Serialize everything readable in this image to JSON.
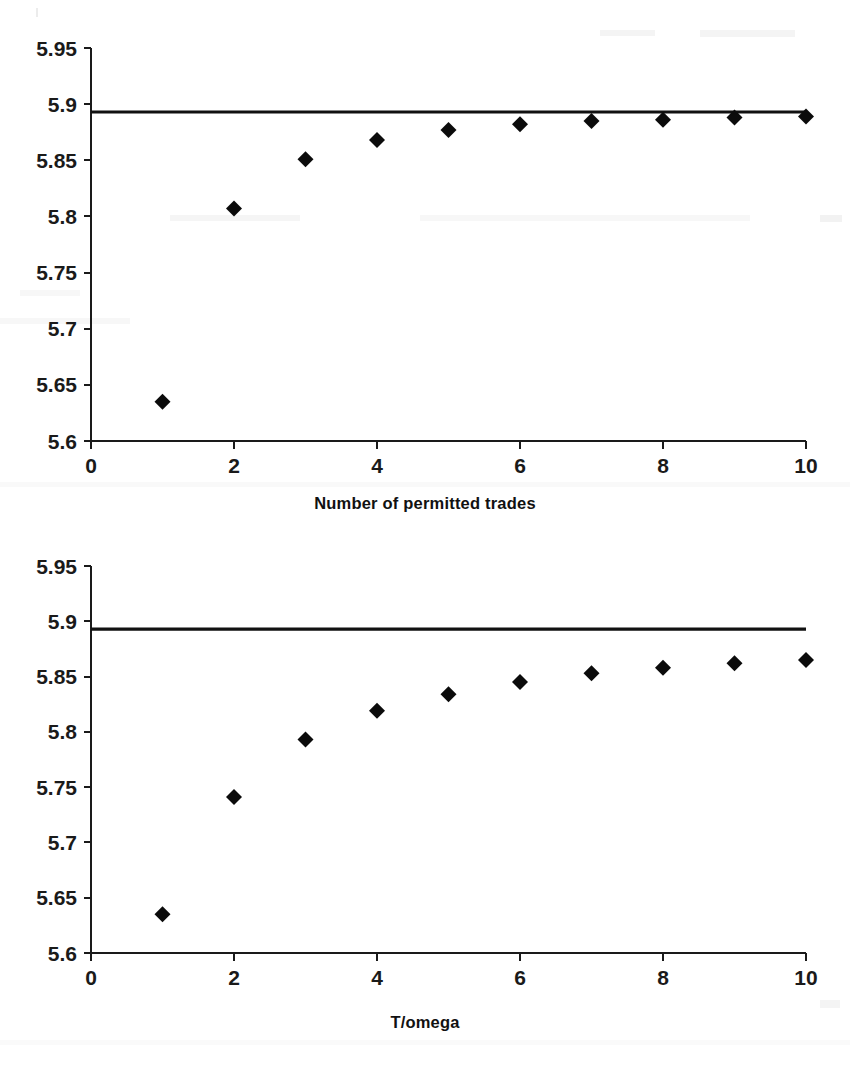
{
  "figure": {
    "background_color": "#ffffff",
    "marker_color": "#0b0b0b",
    "axis_color": "#1a1a1a",
    "reference_line_color": "#111111"
  },
  "chart_data": [
    {
      "id": "top",
      "type": "scatter",
      "title": "",
      "xlabel": "Number of permitted trades",
      "ylabel": "",
      "x": [
        1,
        2,
        3,
        4,
        5,
        6,
        7,
        8,
        9,
        10
      ],
      "values": [
        5.635,
        5.807,
        5.851,
        5.868,
        5.877,
        5.882,
        5.885,
        5.886,
        5.888,
        5.889
      ],
      "series": [
        {
          "name": "expected utility",
          "values": [
            5.635,
            5.807,
            5.851,
            5.868,
            5.877,
            5.882,
            5.885,
            5.886,
            5.888,
            5.889
          ]
        }
      ],
      "reference_line": {
        "name": "continuous-trading benchmark",
        "value": 5.893,
        "orientation": "horizontal"
      },
      "xlim": [
        0,
        10
      ],
      "ylim": [
        5.6,
        5.95
      ],
      "xticks": [
        0,
        2,
        4,
        6,
        8,
        10
      ],
      "xtick_labels": [
        "0",
        "2",
        "4",
        "6",
        "8",
        "10"
      ],
      "yticks": [
        5.6,
        5.65,
        5.7,
        5.75,
        5.8,
        5.85,
        5.9,
        5.95
      ],
      "ytick_labels": [
        "5.6",
        "5.65",
        "5.7",
        "5.75",
        "5.8",
        "5.85",
        "5.9",
        "5.95"
      ],
      "grid": false,
      "legend": false,
      "marker": "diamond"
    },
    {
      "id": "bottom",
      "type": "scatter",
      "title": "",
      "xlabel": "T/omega",
      "ylabel": "",
      "x": [
        1,
        2,
        3,
        4,
        5,
        6,
        7,
        8,
        9,
        10
      ],
      "values": [
        5.635,
        5.741,
        5.793,
        5.819,
        5.834,
        5.845,
        5.853,
        5.858,
        5.862,
        5.865
      ],
      "series": [
        {
          "name": "expected utility",
          "values": [
            5.635,
            5.741,
            5.793,
            5.819,
            5.834,
            5.845,
            5.853,
            5.858,
            5.862,
            5.865
          ]
        }
      ],
      "reference_line": {
        "name": "continuous-trading benchmark",
        "value": 5.893,
        "orientation": "horizontal"
      },
      "xlim": [
        0,
        10
      ],
      "ylim": [
        5.6,
        5.95
      ],
      "xticks": [
        0,
        2,
        4,
        6,
        8,
        10
      ],
      "xtick_labels": [
        "0",
        "2",
        "4",
        "6",
        "8",
        "10"
      ],
      "yticks": [
        5.6,
        5.65,
        5.7,
        5.75,
        5.8,
        5.85,
        5.9,
        5.95
      ],
      "ytick_labels": [
        "5.6",
        "5.65",
        "5.7",
        "5.75",
        "5.8",
        "5.85",
        "5.9",
        "5.95"
      ],
      "grid": false,
      "legend": false,
      "marker": "diamond"
    }
  ]
}
